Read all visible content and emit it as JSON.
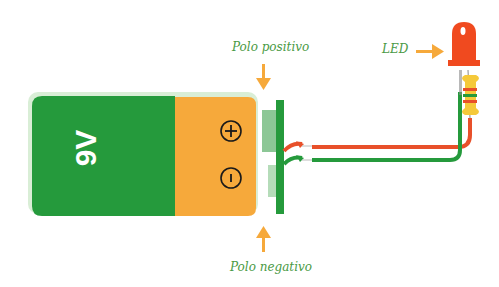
{
  "diagram": {
    "battery": {
      "label": "9V",
      "positive_symbol": "+",
      "negative_symbol": "-"
    },
    "labels": {
      "positive_pole": "Polo positivo",
      "negative_pole": "Polo negativo",
      "led": "LED"
    },
    "colors": {
      "battery_body": "#259a3c",
      "battery_cap": "#f6a93b",
      "arrow": "#f6a93b",
      "label_text": "#4a9a45",
      "wire_red": "#e8502a",
      "wire_green": "#259a3c",
      "led": "#f04a1f",
      "resistor": "#f5c93a"
    }
  }
}
